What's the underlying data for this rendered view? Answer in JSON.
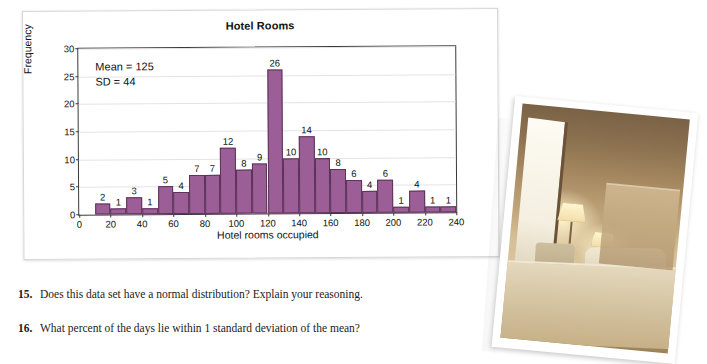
{
  "chart_card": {
    "title": "Hotel Rooms",
    "stats": {
      "mean_label": "Mean = 125",
      "sd_label": "SD = 44"
    }
  },
  "chart_data": {
    "type": "bar",
    "title": "Hotel Rooms",
    "xlabel": "Hotel rooms occupied",
    "ylabel": "Frequency",
    "grid": true,
    "legend": "none",
    "xlim": [
      0,
      240
    ],
    "ylim": [
      0,
      30
    ],
    "ytick_labels": [
      "0",
      "5",
      "10",
      "15",
      "20",
      "25",
      "30"
    ],
    "ytick_values": [
      0,
      5,
      10,
      15,
      20,
      25,
      30
    ],
    "xtick_labels": [
      "0",
      "20",
      "40",
      "60",
      "80",
      "100",
      "120",
      "140",
      "160",
      "180",
      "200",
      "220",
      "240"
    ],
    "xtick_values": [
      0,
      20,
      40,
      60,
      80,
      100,
      120,
      140,
      160,
      180,
      200,
      220,
      240
    ],
    "bin_width": 10,
    "bin_starts": [
      10,
      20,
      30,
      40,
      50,
      60,
      70,
      80,
      90,
      100,
      110,
      120,
      130,
      140,
      150,
      160,
      170,
      180,
      190,
      200,
      210,
      220,
      230
    ],
    "categories": [
      "10-20",
      "20-30",
      "30-40",
      "40-50",
      "50-60",
      "60-70",
      "70-80",
      "80-90",
      "90-100",
      "100-110",
      "110-120",
      "120-130",
      "130-140",
      "140-150",
      "150-160",
      "160-170",
      "170-180",
      "180-190",
      "190-200",
      "200-210",
      "210-220",
      "220-230",
      "230-240"
    ],
    "values": [
      2,
      1,
      3,
      1,
      5,
      4,
      7,
      7,
      12,
      8,
      9,
      26,
      10,
      14,
      10,
      8,
      6,
      4,
      6,
      1,
      4,
      1,
      1
    ],
    "bar_color": "#9c5e96",
    "bar_border_color": "#5d3359",
    "annotations": [
      "Mean = 125",
      "SD = 44"
    ]
  },
  "questions": [
    {
      "number": "15.",
      "text": "Does this data set have a normal distribution? Explain your reasoning."
    },
    {
      "number": "16.",
      "text": "What percent of the days lie within 1 standard deviation of the mean?"
    }
  ],
  "photo": {
    "caption": "hotel-room-photograph"
  }
}
